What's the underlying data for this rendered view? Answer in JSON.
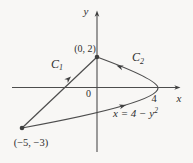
{
  "figure": {
    "axes": {
      "x_label": "x",
      "y_label": "y",
      "origin_label": "0"
    },
    "points": [
      {
        "label": "(0, 2)"
      },
      {
        "label": "(−5, −3)"
      },
      {
        "label": "4"
      }
    ],
    "curves": {
      "c1": {
        "base": "C",
        "sub": "1"
      },
      "c2": {
        "base": "C",
        "sub": "2"
      },
      "equation": {
        "base": "x = 4 − y",
        "exp": "2"
      }
    },
    "colors": {
      "stroke": "#4d4d4d",
      "text": "#2f2f2f",
      "background": "#f8f7f5"
    }
  }
}
